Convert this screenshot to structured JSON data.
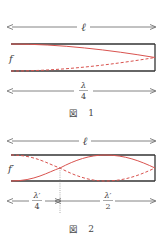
{
  "figure1": {
    "length_label": "ℓ",
    "frequency_label": "f",
    "wavelength_numerator": "λ",
    "wavelength_denominator": "4",
    "caption_prefix": "図",
    "caption_number": "1"
  },
  "figure2": {
    "length_label": "ℓ",
    "frequency_label": "f′",
    "segment1_numerator": "λ′",
    "segment1_denominator": "4",
    "segment2_numerator": "λ′",
    "segment2_denominator": "2",
    "caption_prefix": "図",
    "caption_number": "2"
  },
  "colors": {
    "tube": "#333333",
    "wave": "#d9534f",
    "arrow": "#666666",
    "text": "#444444"
  }
}
